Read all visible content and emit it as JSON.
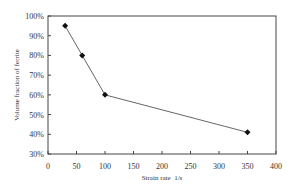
{
  "chart_data": {
    "type": "line",
    "title": "",
    "xlabel": "Strain rate  1/s",
    "ylabel": "Volume fraction of ferrite",
    "x": [
      30,
      60,
      100,
      350
    ],
    "series": [
      {
        "name": "Volume fraction of ferrite",
        "values": [
          95,
          80,
          60,
          41
        ],
        "marker": "diamond"
      }
    ],
    "xlim": [
      0,
      400
    ],
    "ylim": [
      30,
      100
    ],
    "xticks": [
      0,
      50,
      100,
      150,
      200,
      250,
      300,
      350,
      400
    ],
    "yticks": [
      30,
      40,
      50,
      60,
      70,
      80,
      90,
      100
    ],
    "xtick_labels": [
      "0",
      "50",
      "100",
      "150",
      "200",
      "250",
      "300",
      "350",
      "400"
    ],
    "ytick_labels": [
      "30%",
      "40%",
      "50%",
      "60%",
      "70%",
      "80%",
      "90%",
      "100%"
    ],
    "grid": false,
    "legend": null
  },
  "colors": {
    "line": "#555555",
    "marker": "#111111",
    "axis": "#444444"
  }
}
